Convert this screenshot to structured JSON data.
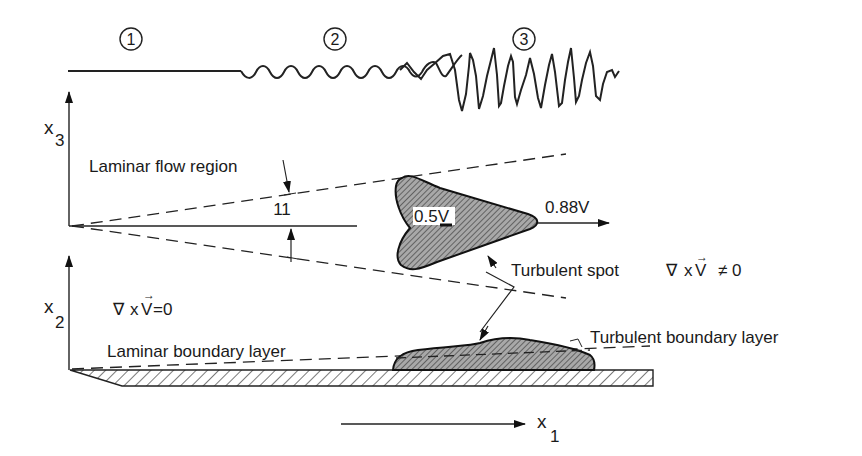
{
  "stages": [
    {
      "number": "1",
      "label": "laminar"
    },
    {
      "number": "2",
      "label": "transition"
    },
    {
      "number": "3",
      "label": "turbulent"
    }
  ],
  "axes": {
    "x3": {
      "main": "x",
      "sub": "3"
    },
    "x2": {
      "main": "x",
      "sub": "2"
    },
    "x1": {
      "main": "x",
      "sub": "1"
    }
  },
  "labels": {
    "laminar_flow_region": "Laminar flow region",
    "spread_angle": "11",
    "spot_rear_velocity": "0.5V",
    "spot_front_velocity": "0.88V",
    "turbulent_spot": "Turbulent spot",
    "curl_nonzero": "∇ xV ≠ 0",
    "curl_nonzero_nabla": "∇",
    "curl_nonzero_x": "x",
    "curl_nonzero_v": "V",
    "curl_nonzero_ne": "≠ 0",
    "curl_zero_nabla": "∇",
    "curl_zero_x": "x",
    "curl_zero_v": "V",
    "curl_zero_eq": "=0",
    "vector_arrow": "→",
    "laminar_boundary_layer": "Laminar boundary layer",
    "turbulent_boundary_layer": "Turbulent boundary layer"
  },
  "colors": {
    "line": "#222222",
    "hatch": "#555555",
    "spot_fill": "#9a9a9a",
    "background": "#ffffff"
  }
}
